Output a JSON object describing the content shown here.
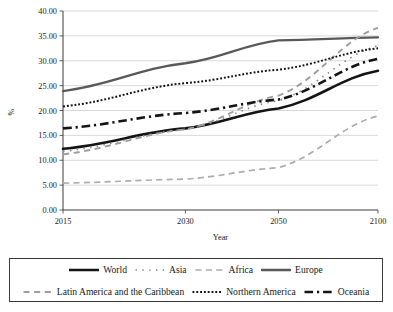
{
  "chart_data": {
    "type": "line",
    "title": "",
    "xlabel": "Year",
    "ylabel": "%",
    "x": [
      2015,
      2030,
      2050,
      2100
    ],
    "xtick_labels": [
      "2015",
      "2030",
      "2050",
      "2100"
    ],
    "ytick_labels": [
      "0.00",
      "5.00",
      "10.00",
      "15.00",
      "20.00",
      "25.00",
      "30.00",
      "35.00",
      "40.00"
    ],
    "ylim": [
      0,
      40
    ],
    "ytick_step": 5,
    "grid": "horizontal",
    "legend_position": "bottom",
    "series": [
      {
        "name": "World",
        "values": [
          12.3,
          16.4,
          20.4,
          28.0
        ],
        "style": "solid",
        "color": "#141414",
        "width": 2.6
      },
      {
        "name": "Asia",
        "values": [
          11.8,
          16.2,
          22.0,
          33.0
        ],
        "style": "dotted-loose",
        "color": "#8c8c8c",
        "width": 1.7
      },
      {
        "name": "Africa",
        "values": [
          5.4,
          6.2,
          8.5,
          18.9
        ],
        "style": "dashed-long",
        "color": "#adadad",
        "width": 1.7
      },
      {
        "name": "Europe",
        "values": [
          23.9,
          29.5,
          34.1,
          34.7
        ],
        "style": "solid",
        "color": "#595959",
        "width": 2.3
      },
      {
        "name": "Latin America and the Caribbean",
        "values": [
          11.2,
          16.2,
          23.0,
          36.6
        ],
        "style": "dashed-medium",
        "color": "#9e9e9e",
        "width": 1.9
      },
      {
        "name": "Northern America",
        "values": [
          20.8,
          25.5,
          28.2,
          32.5
        ],
        "style": "dotted-dense",
        "color": "#141414",
        "width": 2.0
      },
      {
        "name": "Oceania",
        "values": [
          16.4,
          19.5,
          22.2,
          30.4
        ],
        "style": "dash-dot",
        "color": "#141414",
        "width": 2.6
      }
    ]
  },
  "axes": {
    "y_title": "%",
    "x_title": "Year"
  },
  "legend": {
    "rows": [
      [
        {
          "label": "World",
          "swatch": "solid",
          "color": "#141414",
          "width": 2.6
        },
        {
          "label": "Asia",
          "swatch": "dotted-loose",
          "color": "#8c8c8c",
          "width": 1.7
        },
        {
          "label": "Africa",
          "swatch": "dashed-long",
          "color": "#adadad",
          "width": 1.7
        },
        {
          "label": "Europe",
          "swatch": "solid",
          "color": "#595959",
          "width": 2.3
        }
      ],
      [
        {
          "label": "Latin America and the Caribbean",
          "swatch": "dashed-medium",
          "color": "#9e9e9e",
          "width": 1.9
        },
        {
          "label": "Northern America",
          "swatch": "dotted-dense",
          "color": "#141414",
          "width": 2.0
        },
        {
          "label": "Oceania",
          "swatch": "dash-dot",
          "color": "#141414",
          "width": 2.6
        }
      ]
    ]
  },
  "colors": {
    "axis": "#3b3b3b",
    "grid": "#c8c8c8",
    "text": "#1a1a1a",
    "background": "#ffffff"
  }
}
